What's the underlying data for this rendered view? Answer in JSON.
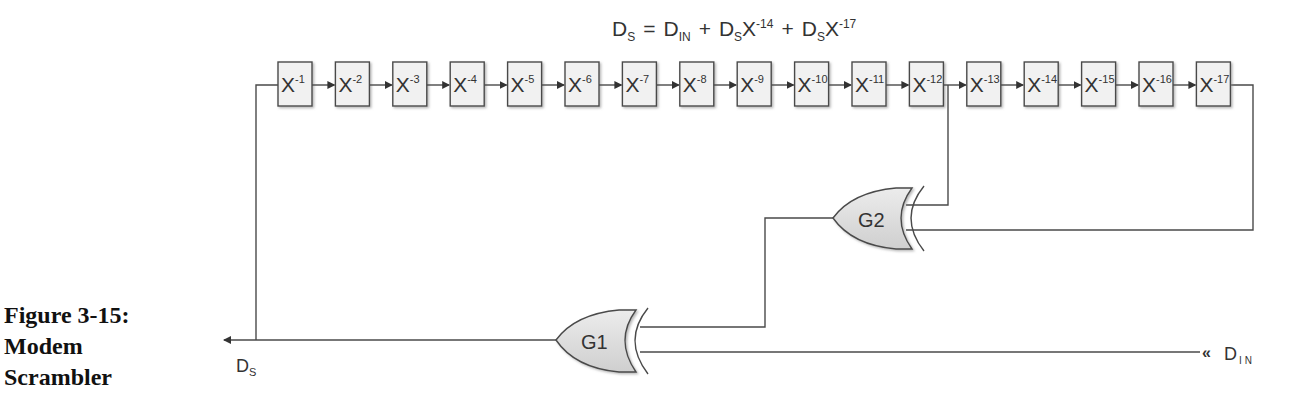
{
  "figure": {
    "caption_lines": [
      "Figure 3-15:",
      "Modem",
      "Scrambler"
    ]
  },
  "equation": {
    "lhs": "D",
    "lhs_sub": "S",
    "eq": "=",
    "t1": "D",
    "t1_sub": "IN",
    "plus1": "+",
    "t2": "D",
    "t2_sub": "S",
    "t2_var": "X",
    "t2_exp": "-14",
    "plus2": "+",
    "t3": "D",
    "t3_sub": "S",
    "t3_var": "X",
    "t3_exp": "-17"
  },
  "shift_register": {
    "var": "X",
    "exponents": [
      "-1",
      "-2",
      "-3",
      "-4",
      "-5",
      "-6",
      "-7",
      "-8",
      "-9",
      "-10",
      "-11",
      "-12",
      "-13",
      "-14",
      "-15",
      "-16",
      "-17"
    ]
  },
  "gates": {
    "g1": {
      "label": "G1",
      "type": "XOR"
    },
    "g2": {
      "label": "G2",
      "type": "XOR"
    }
  },
  "signals": {
    "output": {
      "main": "D",
      "sub": "S"
    },
    "input": {
      "main": "D",
      "sub": "IN",
      "marker": "«"
    }
  },
  "colors": {
    "line": "#4a4a4a",
    "box_fill": "#f1f1f1",
    "gate_fill": "#d9d9d9",
    "text": "#333333"
  }
}
